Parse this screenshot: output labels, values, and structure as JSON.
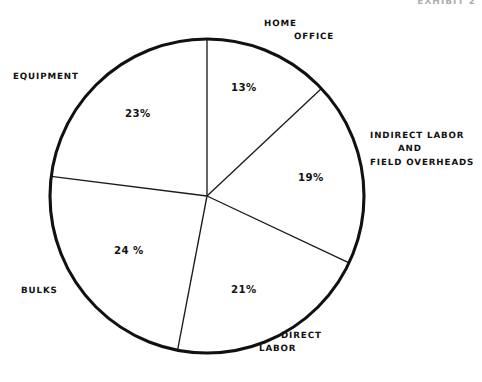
{
  "figure": {
    "caption": "EXHIBIT 2"
  },
  "chart_data": {
    "type": "pie",
    "title": "",
    "subtitle": "",
    "xlabel": "",
    "ylabel": "",
    "grid": false,
    "legend_position": "none",
    "units": "percent",
    "total": 100,
    "start_angle_deg": 0,
    "direction": "clockwise",
    "center": {
      "x": 207,
      "y": 196
    },
    "radius": 157,
    "categories": [
      "HOME OFFICE",
      "INDIRECT LABOR AND FIELD OVERHEADS",
      "DIRECT LABOR",
      "BULKS",
      "EQUIPMENT"
    ],
    "values": [
      13,
      19,
      21,
      24,
      23
    ],
    "slices": [
      {
        "key": "home-office",
        "label_lines": [
          "HOME",
          "OFFICE"
        ],
        "value": 13,
        "value_label": "13%",
        "start_deg": 0,
        "end_deg": 46.8,
        "color": "#ffffff"
      },
      {
        "key": "indirect-labor",
        "label_lines": [
          "INDIRECT  LABOR",
          "AND",
          "FIELD  OVERHEADS"
        ],
        "value": 19,
        "value_label": "19%",
        "start_deg": 46.8,
        "end_deg": 115.2,
        "color": "#ffffff"
      },
      {
        "key": "direct-labor",
        "label_lines": [
          "DIRECT",
          "LABOR"
        ],
        "value": 21,
        "value_label": "21%",
        "start_deg": 115.2,
        "end_deg": 190.8,
        "color": "#ffffff"
      },
      {
        "key": "bulks",
        "label_lines": [
          "BULKS"
        ],
        "value": 24,
        "value_label": "24 %",
        "start_deg": 190.8,
        "end_deg": 277.2,
        "color": "#ffffff"
      },
      {
        "key": "equipment",
        "label_lines": [
          "EQUIPMENT"
        ],
        "value": 23,
        "value_label": "23%",
        "start_deg": 277.2,
        "end_deg": 360,
        "color": "#ffffff"
      }
    ],
    "style": {
      "outline_color": "#111111",
      "divider_color": "#1b1b1b",
      "slice_fill": "#ffffff",
      "text_color": "#121212",
      "background": "#ffffff"
    }
  }
}
